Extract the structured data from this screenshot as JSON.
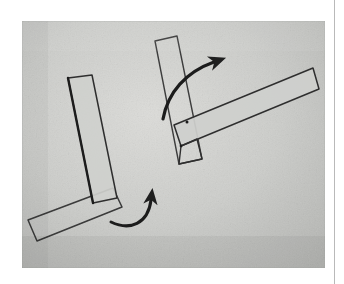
{
  "page": {
    "background_color": "#ffffff",
    "rule_color": "#b9b9b9",
    "alt_text": "Photograph of a hand-drawn diagram on textured paper showing two configurations of crossed rectangular bars with curved rotation arrows."
  },
  "photo": {
    "paper_color": "#c8c8c5",
    "paper_color_light": "#d8d8d5",
    "paper_color_dark": "#b4b4b1",
    "ink_color": "#2b2b2b",
    "ink_color_soft": "#4a4a4a",
    "frame": {
      "x": 22,
      "y": 21,
      "width": 303,
      "height": 247
    }
  },
  "figures": [
    {
      "id": "left-figure",
      "name": "L-shaped bar assembly",
      "description": "A long narrow bar tilted slightly clockwise from vertical, overlapping near its lower end a second long narrow bar that runs down-left to the lower-left corner.",
      "bars": [
        {
          "id": "left-vertical-bar",
          "name": "upright bar",
          "corners": [
            [
              68,
              78
            ],
            [
              92,
              75
            ],
            [
              117,
              198
            ],
            [
              93,
              203
            ]
          ]
        },
        {
          "id": "left-horizontal-bar",
          "name": "lower cross bar",
          "corners": [
            [
              28,
              220
            ],
            [
              113,
              188
            ],
            [
              122,
              207
            ],
            [
              37,
              241
            ]
          ]
        }
      ]
    },
    {
      "id": "right-figure",
      "name": "T-shaped bar assembly",
      "description": "A bar tilted clockwise from vertical crossed near its lower third by a long bar rising to the upper right.",
      "bars": [
        {
          "id": "right-vertical-bar",
          "name": "upright bar",
          "corners": [
            [
              155,
              41
            ],
            [
              177,
              36
            ],
            [
              202,
              159
            ],
            [
              179,
              164
            ]
          ]
        },
        {
          "id": "right-horizontal-bar",
          "name": "cross bar",
          "corners": [
            [
              174,
              125
            ],
            [
              313,
              68
            ],
            [
              319,
              89
            ],
            [
              181,
              146
            ]
          ]
        }
      ]
    }
  ],
  "arrows": [
    {
      "id": "upper-arrow",
      "name": "rotation arrow upper",
      "description": "Thick curved arrow sweeping from lower-left up and to the right, head pointing up-right.",
      "path": "M 163,119 C 168,92 186,72 214,62",
      "head_tip": [
        224,
        57
      ],
      "head_angle_deg": -22,
      "stroke_width": 3.2
    },
    {
      "id": "lower-arrow",
      "name": "rotation arrow lower",
      "description": "Thick curved arrow sweeping from the left up and to the right, head pointing straight up.",
      "path": "M 111,222 C 130,231 148,224 151,200",
      "head_tip": [
        151,
        186
      ],
      "head_angle_deg": -90,
      "stroke_width": 3.0
    }
  ]
}
